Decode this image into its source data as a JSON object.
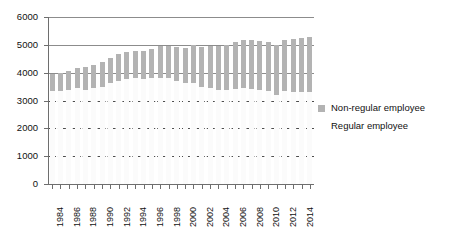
{
  "chart_data": {
    "type": "bar",
    "subtype": "stacked-bar",
    "title": "",
    "subtitle": "",
    "xlabel": "",
    "ylabel": "",
    "ylim": [
      0,
      6000
    ],
    "ytick_values": [
      0,
      1000,
      2000,
      3000,
      4000,
      5000,
      6000
    ],
    "ytick_labels": [
      "0",
      "1000",
      "2000",
      "3000",
      "4000",
      "5000",
      "6000"
    ],
    "grid": true,
    "gridline_styles": {
      "6000": "solid",
      "5000": "solid",
      "4000": "solid",
      "3000": "dashed",
      "2000": "dashed",
      "1000": "dashed",
      "0": "axis"
    },
    "legend_position": "right",
    "categories": [
      "1984",
      "1985",
      "1986",
      "1987",
      "1988",
      "1989",
      "1990",
      "1991",
      "1992",
      "1993",
      "1994",
      "1995",
      "1996",
      "1997",
      "1998",
      "1999",
      "2000",
      "2001",
      "2002",
      "2003",
      "2004",
      "2005",
      "2006",
      "2007",
      "2008",
      "2009",
      "2010",
      "2011",
      "2012",
      "2013",
      "2014",
      "2015"
    ],
    "xtick_labels_shown": [
      "1984",
      "1986",
      "1988",
      "1990",
      "1992",
      "1994",
      "1996",
      "1998",
      "2000",
      "2002",
      "2004",
      "2006",
      "2008",
      "2010",
      "2012",
      "2014"
    ],
    "series": [
      {
        "name": "Regular employee",
        "color": "#fbfbfb",
        "values": [
          3333,
          3343,
          3383,
          3456,
          3377,
          3452,
          3488,
          3639,
          3705,
          3756,
          3805,
          3779,
          3800,
          3812,
          3794,
          3688,
          3630,
          3640,
          3489,
          3444,
          3380,
          3374,
          3411,
          3441,
          3399,
          3395,
          3355,
          3185,
          3340,
          3302,
          3288,
          3317
        ]
      },
      {
        "name": "Non-regular employee",
        "color": "#b3b3b3",
        "values": [
          604,
          655,
          666,
          711,
          817,
          817,
          881,
          897,
          958,
          986,
          971,
          1001,
          1043,
          1152,
          1173,
          1225,
          1273,
          1360,
          1451,
          1504,
          1564,
          1633,
          1678,
          1732,
          1765,
          1727,
          1756,
          1811,
          1816,
          1910,
          1962,
          1980
        ]
      }
    ],
    "totals": [
      3937,
      3998,
      4049,
      4167,
      4194,
      4269,
      4369,
      4536,
      4663,
      4742,
      4776,
      4780,
      4843,
      4964,
      4967,
      4913,
      4903,
      5000,
      4940,
      4948,
      4944,
      5007,
      5089,
      5173,
      5164,
      5122,
      5111,
      4996,
      5156,
      5212,
      5250,
      5297
    ]
  },
  "legend": {
    "items": [
      {
        "label": "Non-regular employee",
        "swatch": "nonregular"
      },
      {
        "label": "Regular employee",
        "swatch": "regular"
      }
    ]
  }
}
